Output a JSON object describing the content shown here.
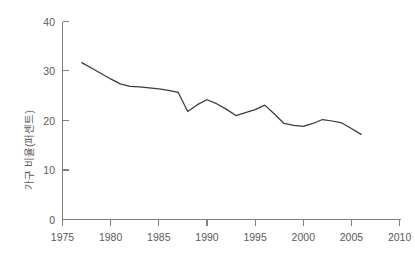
{
  "chart_data": {
    "type": "line",
    "title": "",
    "xlabel": "",
    "ylabel": "가구 비율(퍼센트)",
    "xlim": [
      1975,
      2010
    ],
    "ylim": [
      0,
      40
    ],
    "grid": false,
    "legend": "none",
    "xticks": [
      1975,
      1980,
      1985,
      1990,
      1995,
      2000,
      2005,
      2010
    ],
    "xtick_labels": [
      "1975",
      "1980",
      "1985",
      "1990",
      "1995",
      "2000",
      "2005",
      "2010"
    ],
    "yticks": [
      0,
      10,
      20,
      30,
      40
    ],
    "ytick_labels": [
      "0",
      "10",
      "20",
      "30",
      "40"
    ],
    "line_color": "#3a3a3a",
    "axis_color": "#808080",
    "series": [
      {
        "name": "가구 비율(퍼센트)",
        "x": [
          1977,
          1978,
          1979,
          1980,
          1981,
          1982,
          1983,
          1984,
          1985,
          1986,
          1987,
          1988,
          1989,
          1990,
          1991,
          1992,
          1993,
          1994,
          1995,
          1996,
          1997,
          1998,
          1999,
          2000,
          2001,
          2002,
          2003,
          2004,
          2005,
          2006
        ],
        "values": [
          31.7,
          30.6,
          29.5,
          28.4,
          27.4,
          26.9,
          26.8,
          26.6,
          26.4,
          26.1,
          25.7,
          21.8,
          23.2,
          24.2,
          23.4,
          22.3,
          21.0,
          21.6,
          22.2,
          23.1,
          21.3,
          19.4,
          19.0,
          18.8,
          19.4,
          20.2,
          19.9,
          19.5,
          18.4,
          17.2
        ]
      }
    ]
  },
  "axis_labels": {
    "y_axis_title": "가구 비율(퍼센트)"
  }
}
